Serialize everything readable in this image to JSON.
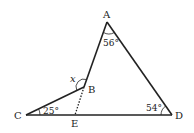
{
  "diagram": {
    "type": "geometry-figure",
    "points": {
      "A": {
        "label": "A",
        "x": 107,
        "y": 22
      },
      "B": {
        "label": "B",
        "x": 84,
        "y": 87
      },
      "C": {
        "label": "C",
        "x": 26,
        "y": 115
      },
      "D": {
        "label": "D",
        "x": 172,
        "y": 115
      },
      "E": {
        "label": "E",
        "x": 75,
        "y": 115
      }
    },
    "segments": [
      {
        "from": "A",
        "to": "B",
        "style": "solid"
      },
      {
        "from": "A",
        "to": "D",
        "style": "solid"
      },
      {
        "from": "C",
        "to": "B",
        "style": "solid"
      },
      {
        "from": "C",
        "to": "D",
        "style": "solid"
      },
      {
        "from": "B",
        "to": "E",
        "style": "dotted"
      }
    ],
    "angles": {
      "A": {
        "text": "56°",
        "vertex": "A"
      },
      "B": {
        "text": "x",
        "vertex": "B",
        "variable": true
      },
      "C": {
        "text": "25°",
        "vertex": "C"
      },
      "D": {
        "text": "54°",
        "vertex": "D"
      }
    },
    "colors": {
      "stroke": "#222222",
      "background": "#ffffff"
    }
  }
}
